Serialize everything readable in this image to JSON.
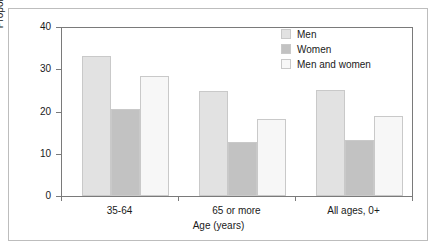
{
  "chart_data": {
    "type": "bar",
    "title": "",
    "subtitle": "",
    "xlabel": "Age (years)",
    "ylabel": "Proportion (%)",
    "categories": [
      "35-64",
      "65 or more",
      "All ages, 0+"
    ],
    "series": [
      {
        "name": "Men",
        "values": [
          33.2,
          24.9,
          25.0
        ],
        "color": "#e2e2e2"
      },
      {
        "name": "Women",
        "values": [
          20.6,
          12.8,
          13.3
        ],
        "color": "#c2c2c2"
      },
      {
        "name": "Men and women",
        "values": [
          28.4,
          18.2,
          19.0
        ],
        "color": "#f7f7f7"
      }
    ],
    "ylim": [
      0,
      40
    ],
    "yticks": [
      0,
      10,
      20,
      30,
      40
    ],
    "ytick_labels": [
      "0",
      "10",
      "20",
      "30",
      "40"
    ],
    "grid": false,
    "legend_position": "top-right",
    "annotations": []
  },
  "legend": {
    "entries": [
      {
        "label": "Men",
        "color": "#e2e2e2"
      },
      {
        "label": "Women",
        "color": "#c2c2c2"
      },
      {
        "label": "Men and women",
        "color": "#f7f7f7"
      }
    ]
  },
  "axes": {
    "y_label": "Proportion (%)",
    "x_label": "Age (years)",
    "y_ticks": [
      "0",
      "10",
      "20",
      "30",
      "40"
    ],
    "x_ticks": [
      "35-64",
      "65 or more",
      "All ages, 0+"
    ]
  },
  "style": {
    "frame_color": "#bdbdbd",
    "axis_color": "#7a7a7a",
    "text_color": "#1a1a1a",
    "background": "#ffffff"
  }
}
